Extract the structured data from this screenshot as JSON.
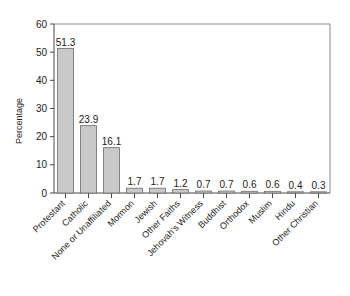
{
  "chart_data": {
    "type": "bar",
    "title": "",
    "xlabel": "",
    "ylabel": "Percentage",
    "ylim": [
      0,
      60
    ],
    "yticks": [
      0,
      10,
      20,
      30,
      40,
      50,
      60
    ],
    "grid": false,
    "legend": "none",
    "categories": [
      "Protestant",
      "Catholic",
      "None or Unaffiliated",
      "Mormon",
      "Jewish",
      "Other Faiths",
      "Jehovah's Witness",
      "Buddhist",
      "Orthodox",
      "Muslim",
      "Hindu",
      "Other Christian"
    ],
    "values": [
      51.3,
      23.9,
      16.1,
      1.7,
      1.7,
      1.2,
      0.7,
      0.7,
      0.6,
      0.6,
      0.4,
      0.3
    ],
    "value_labels": [
      "51.3",
      "23.9",
      "16.1",
      "1.7",
      "1.7",
      "1.2",
      "0.7",
      "0.7",
      "0.6",
      "0.6",
      "0.4",
      "0.3"
    ],
    "bar_color": "#c9c9c9",
    "bar_edge_color": "#6b6b6b",
    "axis_color": "#4a4a4a",
    "frame_color": "#8a8a8a",
    "background_color": "#ffffff"
  }
}
